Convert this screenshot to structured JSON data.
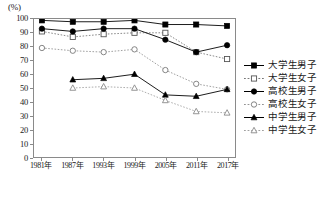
{
  "chart_data": {
    "type": "line",
    "title": "",
    "subtitle": "",
    "unit_label": "(%)",
    "xlabel": "",
    "ylabel": "",
    "ylim": [
      0,
      100
    ],
    "ytick_step": 10,
    "yticks": [
      100,
      90,
      80,
      70,
      60,
      50,
      40,
      30,
      20,
      10,
      0
    ],
    "categories": [
      "1981年",
      "1987年",
      "1993年",
      "1999年",
      "2005年",
      "2011年",
      "2017年"
    ],
    "grid": false,
    "legend_position": "right",
    "series": [
      {
        "name": "大学生男子",
        "marker": "filled-square",
        "line_style": "solid",
        "color": "#000000",
        "values": [
          99,
          98,
          98,
          99,
          96,
          96,
          95
        ]
      },
      {
        "name": "大学生女子",
        "marker": "open-square",
        "line_style": "dashed",
        "color": "#555555",
        "values": [
          91,
          87,
          89,
          90,
          90,
          76,
          71
        ]
      },
      {
        "name": "高校生男子",
        "marker": "filled-circle",
        "line_style": "solid",
        "color": "#000000",
        "values": [
          93,
          91,
          93,
          93,
          85,
          76,
          81
        ]
      },
      {
        "name": "高校生女子",
        "marker": "open-circle",
        "line_style": "dashed",
        "color": "#777777",
        "values": [
          79,
          77,
          76,
          78,
          63,
          53,
          49
        ]
      },
      {
        "name": "中学生男子",
        "marker": "filled-triangle",
        "line_style": "solid",
        "color": "#000000",
        "values": [
          null,
          56,
          57,
          60,
          45,
          44,
          49
        ]
      },
      {
        "name": "中学生女子",
        "marker": "open-triangle",
        "line_style": "dashed",
        "color": "#888888",
        "values": [
          null,
          50,
          51,
          50,
          41,
          33,
          32
        ]
      }
    ]
  }
}
